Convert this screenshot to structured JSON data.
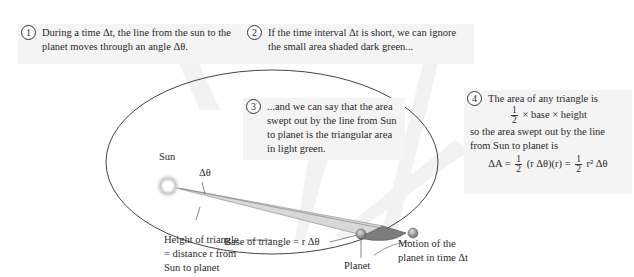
{
  "callouts": [
    {
      "number": "1",
      "text": "During a time Δt, the line from the sun to the planet moves through an angle Δθ."
    },
    {
      "number": "2",
      "text": "If the time interval Δt is short, we can ignore the small area shaded dark green..."
    },
    {
      "number": "3",
      "text": "...and we can say that the area swept out by the line from Sun to planet is the triangular area in light green."
    },
    {
      "number": "4",
      "line1": "The area of any triangle is",
      "formula_triangle": {
        "numerator": "1",
        "denominator": "2",
        "rest": "× base × height"
      },
      "line2": "so the area swept out by the line from Sun to planet is",
      "formula_area": {
        "lhs": "ΔA =",
        "frac1_num": "1",
        "frac1_den": "2",
        "mid": "(r Δθ)(r) =",
        "frac2_num": "1",
        "frac2_den": "2",
        "end": "r² Δθ"
      }
    }
  ],
  "labels": {
    "sun": "Sun",
    "delta_theta": "Δθ",
    "height": "Height of triangle = distance r from Sun to planet",
    "height_lines": [
      "Height of triangle",
      "= distance r from",
      "Sun to planet"
    ],
    "base": "Base of triangle = r Δθ",
    "motion_lines": [
      "Motion of the",
      "planet in time Δt"
    ],
    "planet": "Planet"
  },
  "colors": {
    "light_wedge": "#d6d6d6",
    "dark_wedge": "#7a7a7a",
    "callout_bg": "#f4f4f4",
    "orbit": "#444444"
  }
}
